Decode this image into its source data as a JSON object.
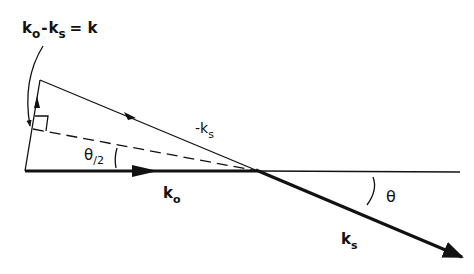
{
  "diagram": {
    "title_equation": {
      "k": "k",
      "o": "o",
      "minus": "-",
      "s": "s",
      "equals": "= k"
    },
    "labels": {
      "neg_ks_prefix": "-k",
      "neg_ks_sub": "s",
      "half_theta": "θ",
      "half_theta_div": "/2",
      "ko_main": "k",
      "ko_sub": "o",
      "theta": "θ",
      "ks_main": "k",
      "ks_sub": "s"
    },
    "colors": {
      "ink": "#111111",
      "background": "#ffffff"
    }
  }
}
